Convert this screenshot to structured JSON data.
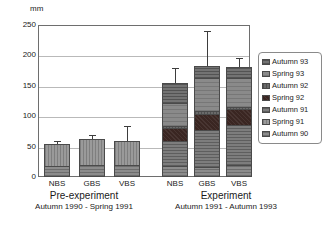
{
  "chart_data": {
    "type": "bar",
    "subtype": "stacked-bar-with-error-bars",
    "title": "",
    "xlabel": "",
    "ylabel": "mm",
    "ylim": [
      0,
      250
    ],
    "yticks": [
      0,
      50,
      100,
      150,
      200,
      250
    ],
    "grid": true,
    "legend_position": "right",
    "categories": [
      "NBS",
      "GBS",
      "VBS",
      "NBS",
      "GBS",
      "VBS"
    ],
    "groups": [
      {
        "title": "Pre-experiment",
        "subtitle": "Autumn 1990 - Spring 1991",
        "categories": [
          "NBS",
          "GBS",
          "VBS"
        ]
      },
      {
        "title": "Experiment",
        "subtitle": "Autumn 1991 - Autumn 1993",
        "categories": [
          "NBS",
          "GBS",
          "VBS"
        ]
      }
    ],
    "series": [
      {
        "name": "Autumn 90",
        "values": [
          15,
          18,
          18,
          16,
          14,
          16
        ]
      },
      {
        "name": "Spring 91",
        "values": [
          39,
          44,
          41,
          0,
          0,
          0
        ]
      },
      {
        "name": "Autumn 91",
        "values": [
          0,
          0,
          0,
          41,
          61,
          68
        ]
      },
      {
        "name": "Spring 92",
        "values": [
          0,
          0,
          0,
          22,
          27,
          26
        ]
      },
      {
        "name": "Autumn 92",
        "values": [
          0,
          0,
          0,
          3,
          5,
          4
        ]
      },
      {
        "name": "Spring 93",
        "values": [
          0,
          0,
          0,
          39,
          56,
          48
        ]
      },
      {
        "name": "Autumn 93",
        "values": [
          0,
          0,
          0,
          33,
          19,
          19
        ]
      }
    ],
    "totals": [
      54,
      62,
      59,
      154,
      182,
      181
    ],
    "error_upper": [
      60,
      69,
      84,
      180,
      240,
      196
    ],
    "annotations": []
  },
  "axis": {
    "unit_label": "mm",
    "tick_labels": [
      "250",
      "200",
      "150",
      "100",
      "50",
      "0"
    ]
  },
  "legend": {
    "items": [
      {
        "label": "Autumn 93",
        "swatch": "autumn93-swatch-icon"
      },
      {
        "label": "Spring 93",
        "swatch": "spring93-swatch-icon"
      },
      {
        "label": "Autumn 92",
        "swatch": "autumn92-swatch-icon"
      },
      {
        "label": "Spring 92",
        "swatch": "spring92-swatch-icon"
      },
      {
        "label": "Autumn 91",
        "swatch": "autumn91-swatch-icon"
      },
      {
        "label": "Spring 91",
        "swatch": "spring91-swatch-icon"
      },
      {
        "label": "Autumn 90",
        "swatch": "autumn90-swatch-icon"
      }
    ]
  },
  "colors": {
    "autumn93": "#737373",
    "spring93": "#8a8a8a",
    "autumn92": "#6a6a6a",
    "spring92": "#3a2622",
    "autumn91": "#7d7d7d",
    "spring91": "#9a9a9a",
    "autumn90": "#8c8c8c",
    "frame": "#6e6e6e",
    "grid": "#b9b9b9",
    "text": "#1a1a1a"
  }
}
